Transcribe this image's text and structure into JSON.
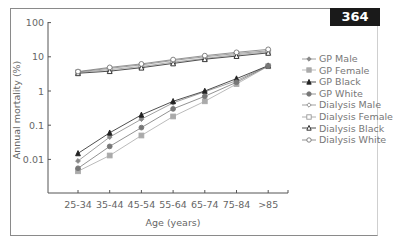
{
  "page_number": "364",
  "chart_data": {
    "type": "line",
    "title": "",
    "xlabel": "Age (years)",
    "ylabel": "Annual mortality (%)",
    "yscale": "log",
    "ylim": [
      0.001,
      100
    ],
    "yticks": [
      "100",
      "10",
      "1",
      "0.1",
      "0.01"
    ],
    "categories": [
      "25-34",
      "35-44",
      "45-54",
      "55-64",
      "65-74",
      "75-84",
      ">85"
    ],
    "grid": false,
    "legend_position": "right",
    "series": [
      {
        "name": "GP Male",
        "marker": "diamond-filled",
        "color": "#888888",
        "values": [
          0.009,
          0.045,
          0.15,
          0.45,
          0.95,
          2.0,
          5.5
        ]
      },
      {
        "name": "GP Female",
        "marker": "square-filled",
        "color": "#aaaaaa",
        "values": [
          0.0045,
          0.013,
          0.05,
          0.18,
          0.5,
          1.6,
          5.3
        ]
      },
      {
        "name": "GP Black",
        "marker": "triangle-filled",
        "color": "#222222",
        "values": [
          0.015,
          0.06,
          0.2,
          0.5,
          1.0,
          2.3,
          5.5
        ]
      },
      {
        "name": "GP White",
        "marker": "circle-filled",
        "color": "#777777",
        "values": [
          0.0055,
          0.024,
          0.085,
          0.3,
          0.7,
          1.8,
          5.4
        ]
      },
      {
        "name": "Dialysis Male",
        "marker": "diamond-open",
        "color": "#888888",
        "values": [
          3.6,
          4.6,
          5.8,
          7.8,
          10.0,
          12.5,
          15.0
        ]
      },
      {
        "name": "Dialysis Female",
        "marker": "square-open",
        "color": "#999999",
        "values": [
          3.5,
          4.2,
          5.2,
          7.0,
          9.0,
          11.5,
          14.0
        ]
      },
      {
        "name": "Dialysis Black",
        "marker": "triangle-open",
        "color": "#222222",
        "values": [
          3.3,
          3.8,
          4.8,
          6.4,
          8.5,
          10.5,
          13.0
        ]
      },
      {
        "name": "Dialysis White",
        "marker": "circle-open",
        "color": "#777777",
        "values": [
          3.7,
          4.9,
          6.2,
          8.3,
          10.8,
          13.5,
          16.5
        ]
      }
    ]
  },
  "legend": {
    "items": [
      "GP Male",
      "GP Female",
      "GP Black",
      "GP White",
      "Dialysis Male",
      "Dialysis Female",
      "Dialysis Black",
      "Dialysis White"
    ]
  }
}
